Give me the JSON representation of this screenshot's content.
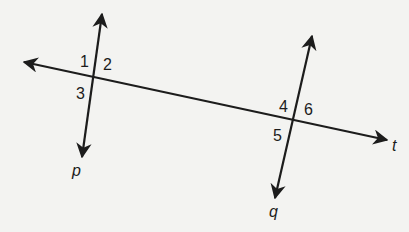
{
  "diagram": {
    "type": "transversal-parallel-lines",
    "background": "#f3f3f1",
    "stroke_color": "#1c1c1c",
    "lines": [
      {
        "name": "t",
        "label": "t",
        "from": [
          24,
          62
        ],
        "to": [
          387,
          140
        ],
        "arrows": "both"
      },
      {
        "name": "p",
        "label": "p",
        "from": [
          102,
          14
        ],
        "to": [
          82,
          157
        ],
        "arrows": "both"
      },
      {
        "name": "q",
        "label": "q",
        "from": [
          312,
          36
        ],
        "to": [
          275,
          198
        ],
        "arrows": "both"
      }
    ],
    "intersections": [
      {
        "lines": [
          "p",
          "t"
        ],
        "point": [
          94,
          76
        ]
      },
      {
        "lines": [
          "q",
          "t"
        ],
        "point": [
          294,
          121
        ]
      }
    ],
    "angle_labels": [
      "1",
      "2",
      "3",
      "4",
      "5",
      "6"
    ],
    "line_labels": {
      "p": "p",
      "q": "q",
      "t": "t"
    }
  }
}
